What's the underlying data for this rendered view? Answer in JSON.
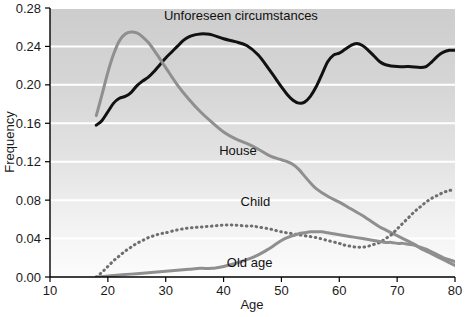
{
  "chart_data": {
    "type": "line",
    "title": "",
    "xlabel": "Age",
    "ylabel": "Frequency",
    "xlim": [
      10,
      80
    ],
    "ylim": [
      0.0,
      0.28
    ],
    "xticks": [
      "10",
      "20",
      "30",
      "40",
      "50",
      "60",
      "70",
      "80"
    ],
    "yticks": [
      "0.00",
      "0.04",
      "0.08",
      "0.12",
      "0.16",
      "0.20",
      "0.24",
      "0.28"
    ],
    "grid": "horizontal-white-gridlines",
    "legend_position": "inline-annotations",
    "background": "vertical gradient light grey (dark top to light bottom)",
    "series": [
      {
        "name": "Unforeseen circumstances",
        "style": "solid",
        "color": "#111111",
        "width": 3.0,
        "label_x": 43,
        "label_y": 0.268,
        "x": [
          18,
          19,
          20,
          21,
          22,
          23,
          24,
          25,
          26,
          27,
          28,
          29,
          30,
          31,
          32,
          33,
          34,
          35,
          36,
          37,
          38,
          40,
          42,
          44,
          46,
          48,
          50,
          51,
          52,
          53,
          54,
          55,
          56,
          57,
          58,
          59,
          60,
          61,
          62,
          63,
          64,
          65,
          66,
          67,
          68,
          70,
          72,
          74,
          75,
          76,
          77,
          78,
          79,
          80
        ],
        "y": [
          0.158,
          0.163,
          0.172,
          0.181,
          0.186,
          0.188,
          0.192,
          0.199,
          0.204,
          0.208,
          0.214,
          0.221,
          0.228,
          0.234,
          0.24,
          0.246,
          0.25,
          0.252,
          0.253,
          0.253,
          0.252,
          0.248,
          0.245,
          0.241,
          0.231,
          0.215,
          0.198,
          0.19,
          0.184,
          0.181,
          0.182,
          0.188,
          0.198,
          0.211,
          0.224,
          0.231,
          0.233,
          0.237,
          0.241,
          0.243,
          0.241,
          0.236,
          0.23,
          0.224,
          0.221,
          0.219,
          0.219,
          0.218,
          0.219,
          0.224,
          0.23,
          0.234,
          0.236,
          0.236
        ]
      },
      {
        "name": "House",
        "style": "solid",
        "color": "#8f8f8f",
        "width": 3.0,
        "label_x": 42.5,
        "label_y": 0.127,
        "x": [
          18,
          19,
          20,
          21,
          22,
          23,
          24,
          25,
          26,
          27,
          28,
          29,
          30,
          32,
          34,
          36,
          38,
          40,
          42,
          44,
          46,
          48,
          50,
          51,
          52,
          53,
          54,
          55,
          56,
          58,
          60,
          62,
          64,
          65,
          66,
          67,
          68,
          69,
          70,
          71,
          72,
          73,
          74,
          75,
          76,
          77,
          78,
          79,
          80
        ],
        "y": [
          0.168,
          0.19,
          0.213,
          0.232,
          0.246,
          0.253,
          0.255,
          0.254,
          0.25,
          0.244,
          0.236,
          0.227,
          0.218,
          0.2,
          0.185,
          0.172,
          0.161,
          0.151,
          0.144,
          0.139,
          0.133,
          0.126,
          0.122,
          0.12,
          0.117,
          0.112,
          0.105,
          0.098,
          0.092,
          0.084,
          0.078,
          0.071,
          0.064,
          0.06,
          0.056,
          0.052,
          0.049,
          0.046,
          0.043,
          0.04,
          0.037,
          0.034,
          0.03,
          0.027,
          0.024,
          0.021,
          0.018,
          0.015,
          0.012
        ]
      },
      {
        "name": "Child",
        "style": "dotted",
        "color": "#6e6e6e",
        "width": 3.0,
        "label_x": 45.5,
        "label_y": 0.074,
        "x": [
          18,
          19,
          20,
          21,
          22,
          23,
          24,
          25,
          26,
          27,
          28,
          29,
          30,
          32,
          34,
          36,
          38,
          40,
          42,
          44,
          45,
          46,
          48,
          50,
          52,
          54,
          56,
          58,
          60,
          61,
          62,
          63,
          64,
          65,
          66,
          67,
          68,
          69,
          70,
          71,
          72,
          73,
          74,
          75,
          76,
          77,
          78,
          79,
          80
        ],
        "y": [
          0.0,
          0.005,
          0.011,
          0.017,
          0.022,
          0.027,
          0.031,
          0.035,
          0.038,
          0.041,
          0.043,
          0.045,
          0.046,
          0.049,
          0.051,
          0.052,
          0.053,
          0.054,
          0.054,
          0.053,
          0.053,
          0.052,
          0.05,
          0.047,
          0.045,
          0.043,
          0.041,
          0.038,
          0.035,
          0.033,
          0.032,
          0.031,
          0.031,
          0.032,
          0.034,
          0.036,
          0.04,
          0.044,
          0.05,
          0.056,
          0.062,
          0.068,
          0.073,
          0.078,
          0.082,
          0.085,
          0.088,
          0.09,
          0.091
        ]
      },
      {
        "name": "Old age",
        "style": "solid",
        "color": "#8f8f8f",
        "width": 3.0,
        "label_x": 44.5,
        "label_y": 0.01,
        "x": [
          18,
          20,
          22,
          24,
          26,
          28,
          30,
          32,
          34,
          36,
          38,
          40,
          42,
          44,
          46,
          48,
          49,
          50,
          51,
          52,
          53,
          54,
          55,
          56,
          57,
          58,
          59,
          60,
          61,
          62,
          63,
          64,
          65,
          66,
          67,
          68,
          69,
          70,
          71,
          72,
          73,
          74,
          75,
          76,
          77,
          78,
          79,
          80
        ],
        "y": [
          0.0,
          0.001,
          0.002,
          0.003,
          0.004,
          0.005,
          0.006,
          0.007,
          0.008,
          0.009,
          0.009,
          0.011,
          0.014,
          0.018,
          0.023,
          0.03,
          0.034,
          0.038,
          0.041,
          0.043,
          0.045,
          0.046,
          0.047,
          0.047,
          0.047,
          0.046,
          0.045,
          0.044,
          0.043,
          0.042,
          0.041,
          0.04,
          0.039,
          0.038,
          0.037,
          0.036,
          0.036,
          0.035,
          0.035,
          0.034,
          0.033,
          0.031,
          0.029,
          0.026,
          0.023,
          0.02,
          0.018,
          0.016
        ]
      }
    ]
  },
  "axes": {
    "x_title": "Age",
    "y_title": "Frequency"
  },
  "colors": {
    "black_series": "#111111",
    "grey_series": "#8f8f8f",
    "dotted_series": "#6e6e6e",
    "gridline": "#ffffff",
    "axis": "#000000",
    "plot_bg_top": "#cfcfcf",
    "plot_bg_bottom": "#fbfbfb"
  }
}
